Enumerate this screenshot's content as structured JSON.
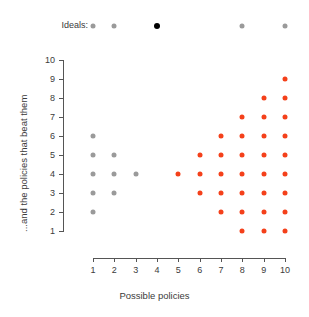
{
  "chart_data": {
    "type": "scatter",
    "title": "",
    "xlabel": "Possible policies",
    "ylabel": "...and the policies that beat them",
    "xlim": [
      1,
      10
    ],
    "ylim": [
      1,
      10
    ],
    "xticks": [
      1,
      2,
      3,
      4,
      5,
      6,
      7,
      8,
      9,
      10
    ],
    "yticks": [
      1,
      2,
      3,
      4,
      5,
      6,
      7,
      8,
      9,
      10
    ],
    "grid": false,
    "legend": "none",
    "colors": {
      "gray": "#9a9a9a",
      "red": "#f4401a",
      "black": "#000000",
      "axis": "#555555",
      "text": "#3b3b3b",
      "background": "#ffffff"
    },
    "series": [
      {
        "name": "gray-points",
        "color": "#9a9a9a",
        "points": [
          {
            "x": 1,
            "y": 2
          },
          {
            "x": 1,
            "y": 3
          },
          {
            "x": 1,
            "y": 4
          },
          {
            "x": 1,
            "y": 5
          },
          {
            "x": 1,
            "y": 6
          },
          {
            "x": 2,
            "y": 3
          },
          {
            "x": 2,
            "y": 4
          },
          {
            "x": 2,
            "y": 5
          },
          {
            "x": 3,
            "y": 4
          }
        ]
      },
      {
        "name": "red-points",
        "color": "#f4401a",
        "points": [
          {
            "x": 5,
            "y": 4
          },
          {
            "x": 6,
            "y": 3
          },
          {
            "x": 6,
            "y": 4
          },
          {
            "x": 6,
            "y": 5
          },
          {
            "x": 7,
            "y": 2
          },
          {
            "x": 7,
            "y": 3
          },
          {
            "x": 7,
            "y": 4
          },
          {
            "x": 7,
            "y": 5
          },
          {
            "x": 7,
            "y": 6
          },
          {
            "x": 8,
            "y": 1
          },
          {
            "x": 8,
            "y": 2
          },
          {
            "x": 8,
            "y": 3
          },
          {
            "x": 8,
            "y": 4
          },
          {
            "x": 8,
            "y": 5
          },
          {
            "x": 8,
            "y": 6
          },
          {
            "x": 8,
            "y": 7
          },
          {
            "x": 9,
            "y": 1
          },
          {
            "x": 9,
            "y": 2
          },
          {
            "x": 9,
            "y": 3
          },
          {
            "x": 9,
            "y": 4
          },
          {
            "x": 9,
            "y": 5
          },
          {
            "x": 9,
            "y": 6
          },
          {
            "x": 9,
            "y": 7
          },
          {
            "x": 9,
            "y": 8
          },
          {
            "x": 10,
            "y": 1
          },
          {
            "x": 10,
            "y": 2
          },
          {
            "x": 10,
            "y": 3
          },
          {
            "x": 10,
            "y": 4
          },
          {
            "x": 10,
            "y": 5
          },
          {
            "x": 10,
            "y": 6
          },
          {
            "x": 10,
            "y": 7
          },
          {
            "x": 10,
            "y": 8
          },
          {
            "x": 10,
            "y": 9
          }
        ]
      }
    ],
    "annotations": {
      "ideals_label": "Ideals:",
      "ideals_points": [
        {
          "x": 1,
          "color": "#9a9a9a",
          "filled": true
        },
        {
          "x": 2,
          "color": "#9a9a9a",
          "filled": true
        },
        {
          "x": 4,
          "color": "#000000",
          "filled": true
        },
        {
          "x": 8,
          "color": "#9a9a9a",
          "filled": true
        },
        {
          "x": 10,
          "color": "#9a9a9a",
          "filled": true
        }
      ]
    }
  }
}
